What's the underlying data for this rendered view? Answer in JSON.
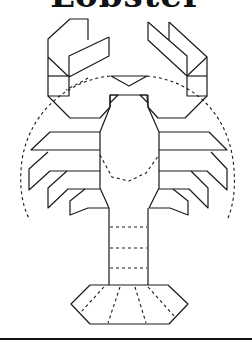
{
  "title": "Lobster",
  "diagram": {
    "subject": "lobster",
    "style": "line-drawing with dashed fold lines",
    "parts": [
      "left-claw",
      "right-claw",
      "head",
      "body",
      "left-legs",
      "right-legs",
      "antennae",
      "tail-segments",
      "tail-fan"
    ],
    "colors": {
      "line": "#1a1a1a",
      "background": "#ffffff"
    }
  }
}
